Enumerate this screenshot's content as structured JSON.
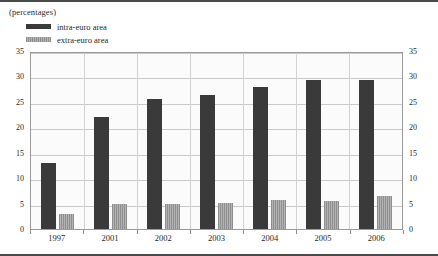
{
  "chart_title": "(percentages)",
  "legend": {
    "items": [
      {
        "label": "intra-euro area",
        "color": "#3a3a3a",
        "swatch_name": "legend-swatch-intra"
      },
      {
        "label": "extra-euro area",
        "color": "#9a9a9a",
        "swatch_name": "legend-swatch-extra"
      }
    ]
  },
  "axis": {
    "y_ticks": [
      "35",
      "30",
      "25",
      "20",
      "15",
      "10",
      "5",
      "0"
    ],
    "y_min": 0,
    "y_max": 35
  },
  "chart_data": {
    "type": "bar",
    "title": "(percentages)",
    "xlabel": "",
    "ylabel": "",
    "ylim": [
      0,
      35
    ],
    "ytick_values": [
      0,
      5,
      10,
      15,
      20,
      25,
      30,
      35
    ],
    "grid": true,
    "legend_position": "top-left",
    "categories": [
      "1997",
      "2001",
      "2002",
      "2003",
      "2004",
      "2005",
      "2006"
    ],
    "series": [
      {
        "name": "intra-euro area",
        "color": "#3a3a3a",
        "values": [
          13.0,
          22.1,
          25.5,
          26.3,
          28.0,
          29.3,
          29.3
        ]
      },
      {
        "name": "extra-euro area",
        "color": "#9a9a9a",
        "values": [
          3.0,
          5.0,
          5.0,
          5.2,
          5.8,
          5.6,
          6.4
        ]
      }
    ]
  }
}
